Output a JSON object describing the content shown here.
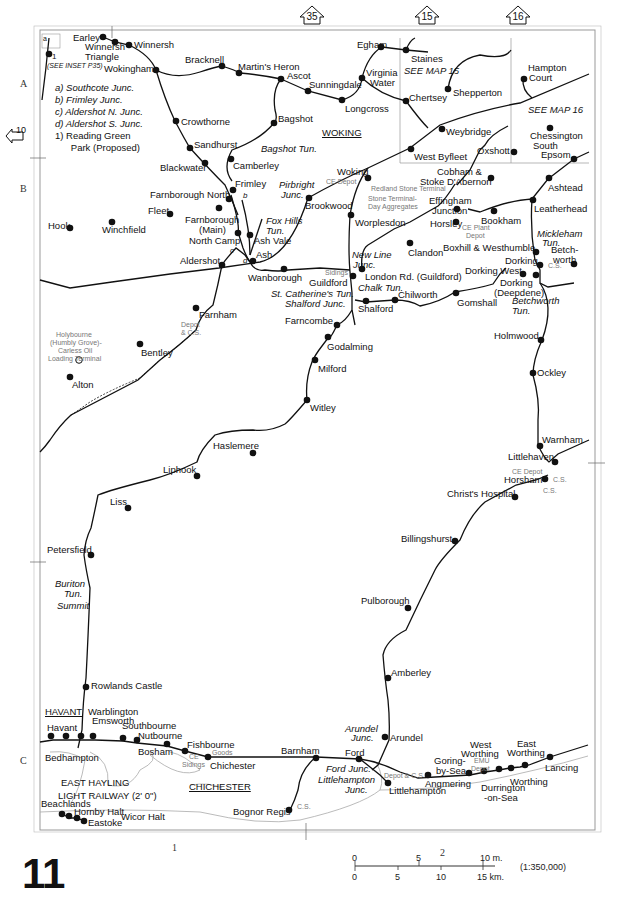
{
  "map": {
    "page_number": "11",
    "scale_ratio": "(1:350,000)",
    "scale_miles": [
      "0",
      "5",
      "10 m."
    ],
    "scale_km": [
      "0",
      "5",
      "10",
      "15 km."
    ],
    "grid_rows": [
      "A",
      "B",
      "C"
    ],
    "grid_cols": [
      "1",
      "2"
    ],
    "adjacent_maps": {
      "top_35": "35",
      "top_15": "15",
      "top_16": "16",
      "left_10": "10"
    },
    "inset_note": "(SEE INSET P35)",
    "inset_label_a": "a",
    "inset_label_1": "1",
    "see_map_15": "SEE MAP 15",
    "see_map_16": "SEE MAP 16",
    "legend": [
      "a)  Southcote Junc.",
      "b)  Frimley Junc.",
      "c)  Aldershot N. Junc.",
      "d)  Aldershot S. Junc.",
      "1)  Reading Green",
      "      Park (Proposed)"
    ],
    "towns": {
      "woking": "WOKING",
      "havant": "HAVANT",
      "chichester": "CHICHESTER"
    },
    "east_hayling": [
      "EAST HAYLING",
      "LIGHT RAILWAY (2' 0\")"
    ],
    "stations": {
      "earley": "Earley",
      "winnersh_tri_1": "Winnersh",
      "winnersh_tri_2": "Triangle",
      "winnersh": "Winnersh",
      "wokingham": "Wokingham",
      "bracknell": "Bracknell",
      "martins_heron": "Martin's Heron",
      "ascot": "Ascot",
      "sunningdale": "Sunningdale",
      "longcross": "Longcross",
      "virginia_1": "Virginia",
      "virginia_2": "Water",
      "egham": "Egham",
      "staines": "Staines",
      "chertsey": "Chertsey",
      "shepperton": "Shepperton",
      "weybridge": "Weybridge",
      "west_byfleet": "West Byfleet",
      "hampton_1": "Hampton",
      "hampton_2": "Court",
      "chessington_1": "Chessington",
      "chessington_2": "South",
      "epsom": "Epsom",
      "oxshott": "Oxshott",
      "crowthorne": "Crowthorne",
      "sandhurst": "Sandhurst",
      "bagshot": "Bagshot",
      "blackwater": "Blackwater",
      "camberley": "Camberley",
      "frimley": "Frimley",
      "farnborough_north": "Farnborough North",
      "farnborough_main_1": "Farnborough",
      "farnborough_main_2": "(Main)",
      "north_camp": "North Camp",
      "ash_vale": "Ash Vale",
      "ash": "Ash",
      "aldershot": "Aldershot",
      "wanborough": "Wanborough",
      "hook": "Hook",
      "winchfield": "Winchfield",
      "fleet": "Fleet",
      "brookwood": "Brookwood",
      "woking_stn": "Woking",
      "worplesdon": "Worplesdon",
      "cobham_1": "Cobham &",
      "cobham_2": "Stoke D'Abernon",
      "effingham_1": "Effingham",
      "effingham_2": "Junction",
      "horsley": "Horsley",
      "bookham": "Bookham",
      "clandon": "Clandon",
      "ashtead": "Ashtead",
      "leatherhead": "Leatherhead",
      "boxhill": "Boxhill & Westhumble",
      "betchworth_1": "Betch-",
      "betchworth_2": "worth",
      "dorking": "Dorking",
      "dorking_west": "Dorking West",
      "dorking_deep_1": "Dorking",
      "dorking_deep_2": "(Deepdene)",
      "london_rd": "London Rd. (Guildford)",
      "guildford": "Guildford",
      "shalford": "Shalford",
      "chilworth": "Chilworth",
      "gomshall": "Gomshall",
      "farncombe": "Farncombe",
      "godalming": "Godalming",
      "milford": "Milford",
      "witley": "Witley",
      "haslemere": "Haslemere",
      "liphook": "Liphook",
      "liss": "Liss",
      "petersfield": "Petersfield",
      "rowlands_castle": "Rowlands Castle",
      "farnham": "Farnham",
      "bentley": "Bentley",
      "alton": "Alton",
      "holmwood": "Holmwood",
      "ockley": "Ockley",
      "warnham": "Warnham",
      "littlehaven": "Littlehaven",
      "horsham": "Horsham",
      "christs_hospital": "Christ's Hospital",
      "billingshurst": "Billingshurst",
      "pulborough": "Pulborough",
      "amberley": "Amberley",
      "arundel": "Arundel",
      "warblington": "Warblington",
      "emsworth": "Emsworth",
      "havant_stn": "Havant",
      "bedhampton": "Bedhampton",
      "southbourne": "Southbourne",
      "nutbourne": "Nutbourne",
      "bosham": "Bosham",
      "fishbourne": "Fishbourne",
      "chichester_stn": "Chichester",
      "barnham": "Barnham",
      "bognor": "Bognor Regis",
      "ford": "Ford",
      "littlehampton": "Littlehampton",
      "angmering": "Angmering",
      "goring_1": "Goring-",
      "goring_2": "by-Sea",
      "west_worthing_1": "West",
      "west_worthing_2": "Worthing",
      "durrington_1": "Durrington",
      "durrington_2": "-on-Sea",
      "worthing": "Worthing",
      "east_worthing_1": "East",
      "east_worthing_2": "Worthing",
      "lancing": "Lancing",
      "beachlands": "Beachlands",
      "hornby_halt": "Hornby Halt",
      "wicor_halt": "Wicor Halt",
      "eastoke": "Eastoke"
    },
    "junctions": {
      "pirbright_1": "Pirbright",
      "pirbright_2": "Junc.",
      "fox_hills_1": "Fox Hills",
      "fox_hills_2": "Tun.",
      "bagshot_tun": "Bagshot Tun.",
      "new_line_1": "New Line",
      "new_line_2": "Junc.",
      "chalk_tun": "Chalk Tun.",
      "st_catherines": "St. Catherine's Tun.",
      "shalford_junc": "Shalford Junc.",
      "mickleham_1": "Mickleham",
      "mickleham_2": "Tun.",
      "betchworth_tun_1": "Betchworth",
      "betchworth_tun_2": "Tun.",
      "buriton_1": "Buriton",
      "buriton_2": "Tun.",
      "summit": "Summit",
      "arundel_junc_1": "Arundel",
      "arundel_junc_2": "Junc.",
      "ford_junc": "Ford Junc.",
      "littlehampton_junc_1": "Littlehampton",
      "littlehampton_junc_2": "Junc.",
      "b": "b",
      "c": "c",
      "d": "d"
    },
    "facilities": {
      "ce_depot_woking": "CE Depot",
      "redland": "Redland Stone Terminal",
      "stone_terminal_1": "Stone Terminal-",
      "stone_terminal_2": "Day Aggregates",
      "ce_plant_1": "CE Plant",
      "ce_plant_2": "Depot",
      "sidings_guildford": "Sidings",
      "cs_dorking": "C.S.",
      "depot_farnham_1": "Depot",
      "depot_farnham_2": "& C.S.",
      "holybourne_1": "Holybourne",
      "holybourne_2": "(Humbly Grove)-",
      "holybourne_3": "Carless Oil",
      "holybourne_4": "Loading Terminal",
      "ce_depot_horsham": "CE Depot",
      "cs_horsham_1": "C.S.",
      "cs_horsham_2": "C.S.",
      "ce_sidings_1": "CE",
      "ce_sidings_2": "Sidings",
      "goods": "Goods",
      "cs_bognor": "C.S.",
      "depot_cs_ford": "Depot & C.S.",
      "emu_1": "EMU",
      "emu_2": "Depot"
    }
  }
}
